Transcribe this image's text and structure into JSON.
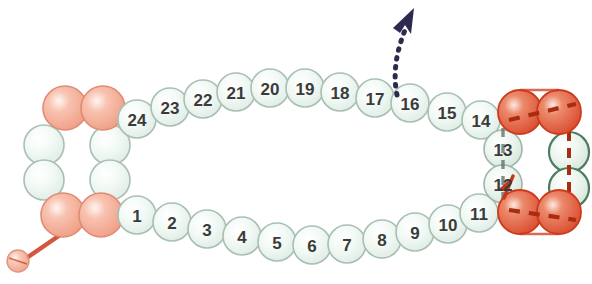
{
  "figure": {
    "kind": "beading-pattern-diagram",
    "title": "",
    "background_color": "#ffffff",
    "width": 592,
    "height": 284
  },
  "palette": {
    "bead_green_fill": "#eaf3ee",
    "bead_green_highlight": "#ffffff",
    "bead_green_outline": "#a9bfb4",
    "bead_green_dark_outline": "#4d7c60",
    "bead_pink_fill": "#f2a893",
    "bead_pink_outline": "#e08b73",
    "bead_red_fill": "#e2694a",
    "bead_red_outline": "#cc3a1c",
    "thread_red": "#c4371a",
    "thread_dark_red": "#a82c12",
    "thread_grey": "#5f6f66",
    "arrow_navy": "#2b2b4e",
    "number_color": "#3b3b3b"
  },
  "numbered_beads": {
    "bottom_row": [
      {
        "label": "1",
        "cx": 137,
        "cy": 215,
        "r": 19
      },
      {
        "label": "2",
        "cx": 172,
        "cy": 222,
        "r": 19
      },
      {
        "label": "3",
        "cx": 207,
        "cy": 229,
        "r": 19
      },
      {
        "label": "4",
        "cx": 242,
        "cy": 236,
        "r": 19
      },
      {
        "label": "5",
        "cx": 277,
        "cy": 242,
        "r": 19
      },
      {
        "label": "6",
        "cx": 312,
        "cy": 245,
        "r": 19
      },
      {
        "label": "7",
        "cx": 347,
        "cy": 244,
        "r": 19
      },
      {
        "label": "8",
        "cx": 382,
        "cy": 239,
        "r": 19
      },
      {
        "label": "9",
        "cx": 415,
        "cy": 232,
        "r": 19
      },
      {
        "label": "10",
        "cx": 448,
        "cy": 224,
        "r": 19
      },
      {
        "label": "11",
        "cx": 479,
        "cy": 213,
        "r": 19
      }
    ],
    "right_column": [
      {
        "label": "12",
        "cx": 503,
        "cy": 184,
        "r": 19
      },
      {
        "label": "13",
        "cx": 503,
        "cy": 149,
        "r": 19
      }
    ],
    "top_row": [
      {
        "label": "14",
        "cx": 481,
        "cy": 120,
        "r": 19
      },
      {
        "label": "15",
        "cx": 447,
        "cy": 112,
        "r": 19
      },
      {
        "label": "16",
        "cx": 410,
        "cy": 103,
        "r": 19
      },
      {
        "label": "17",
        "cx": 375,
        "cy": 98,
        "r": 19
      },
      {
        "label": "18",
        "cx": 340,
        "cy": 92,
        "r": 19
      },
      {
        "label": "19",
        "cx": 305,
        "cy": 88,
        "r": 19
      },
      {
        "label": "20",
        "cx": 270,
        "cy": 88,
        "r": 19
      },
      {
        "label": "21",
        "cx": 236,
        "cy": 92,
        "r": 19
      },
      {
        "label": "22",
        "cx": 203,
        "cy": 99,
        "r": 19
      },
      {
        "label": "23",
        "cx": 170,
        "cy": 107,
        "r": 19
      },
      {
        "label": "24",
        "cx": 137,
        "cy": 119,
        "r": 19
      }
    ]
  },
  "left_ring": {
    "name": "left-toggle-ring",
    "beads": [
      {
        "color": "pink",
        "cx": 65,
        "cy": 108,
        "r": 22,
        "position": "top-left"
      },
      {
        "color": "pink",
        "cx": 103,
        "cy": 108,
        "r": 22,
        "position": "top-right"
      },
      {
        "color": "green",
        "cx": 44,
        "cy": 145,
        "r": 20,
        "position": "left-upper"
      },
      {
        "color": "green",
        "cx": 44,
        "cy": 180,
        "r": 20,
        "position": "left-lower"
      },
      {
        "color": "green",
        "cx": 110,
        "cy": 145,
        "r": 20,
        "position": "right-upper"
      },
      {
        "color": "green",
        "cx": 110,
        "cy": 180,
        "r": 20,
        "position": "right-lower"
      },
      {
        "color": "pink",
        "cx": 63,
        "cy": 215,
        "r": 22,
        "position": "bottom-left"
      },
      {
        "color": "pink",
        "cx": 101,
        "cy": 215,
        "r": 22,
        "position": "bottom-right"
      }
    ],
    "tail": {
      "from_x": 62,
      "from_y": 236,
      "to_x": 28,
      "to_y": 258
    },
    "tail_bead": {
      "cx": 18,
      "cy": 261,
      "r": 11,
      "color": "pink"
    }
  },
  "right_ring": {
    "name": "right-toggle-ring",
    "beads": [
      {
        "color": "red",
        "cx": 520,
        "cy": 112,
        "r": 22,
        "position": "top-left"
      },
      {
        "color": "red",
        "cx": 559,
        "cy": 112,
        "r": 22,
        "position": "top-right"
      },
      {
        "color": "green_dark",
        "cx": 569,
        "cy": 152,
        "r": 20,
        "position": "right-upper"
      },
      {
        "color": "green_dark",
        "cx": 569,
        "cy": 188,
        "r": 20,
        "position": "right-lower"
      },
      {
        "color": "red",
        "cx": 520,
        "cy": 212,
        "r": 22,
        "position": "bottom-left"
      },
      {
        "color": "red",
        "cx": 559,
        "cy": 212,
        "r": 22,
        "position": "bottom-right"
      }
    ]
  },
  "thread_paths": {
    "needle_exit_arrow": {
      "name": "needle-direction-arrow",
      "color": "#2b2b4e",
      "style": "dotted",
      "start_x": 397,
      "start_y": 95,
      "end_x": 409,
      "end_y": 22,
      "description": "dotted arrow exiting between beads 16 and 17 pointing up"
    },
    "right_ring_dashed": {
      "color": "#a82c12",
      "style": "dashed",
      "description": "dashed thread through right ring beads"
    },
    "bead_12_arrow": {
      "color": "#c4371a",
      "description": "small red arrowhead beside bead 12 pointing up-left"
    },
    "column_12_13_dashed": {
      "color": "#5f6f66",
      "style": "dashed",
      "description": "grey dashed thread running vertically through beads 12 and 13"
    }
  }
}
